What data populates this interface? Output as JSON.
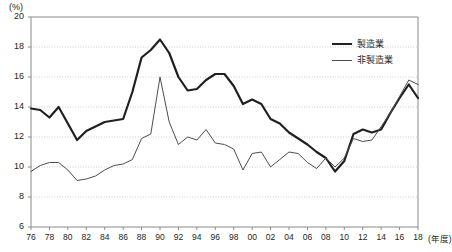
{
  "chart_data": {
    "type": "line",
    "title": "",
    "subtitle": "",
    "xlabel": "(年度)",
    "ylabel": "(%)",
    "unit_label": "(%)",
    "xlim": [
      1976,
      2018
    ],
    "ylim": [
      6,
      20
    ],
    "y_ticks": [
      6,
      8,
      10,
      12,
      14,
      16,
      18,
      20
    ],
    "y_tick_labels": [
      "6",
      "8",
      "10",
      "12",
      "14",
      "16",
      "18",
      "20"
    ],
    "x_ticks": [
      1976,
      1978,
      1980,
      1982,
      1984,
      1986,
      1988,
      1990,
      1992,
      1994,
      1996,
      1998,
      2000,
      2002,
      2004,
      2006,
      2008,
      2010,
      2012,
      2014,
      2016,
      2018
    ],
    "x_tick_labels": [
      "76",
      "78",
      "80",
      "82",
      "84",
      "86",
      "88",
      "90",
      "92",
      "94",
      "96",
      "98",
      "00",
      "02",
      "04",
      "06",
      "08",
      "10",
      "12",
      "14",
      "16",
      "18"
    ],
    "grid": true,
    "grid_style": "dotted-horizontal",
    "legend_position": "top-right",
    "x": [
      1976,
      1977,
      1978,
      1979,
      1980,
      1981,
      1982,
      1983,
      1984,
      1985,
      1986,
      1987,
      1988,
      1989,
      1990,
      1991,
      1992,
      1993,
      1994,
      1995,
      1996,
      1997,
      1998,
      1999,
      2000,
      2001,
      2002,
      2003,
      2004,
      2005,
      2006,
      2007,
      2008,
      2009,
      2010,
      2011,
      2012,
      2013,
      2014,
      2015,
      2016,
      2017,
      2018
    ],
    "series": [
      {
        "name": "製造業",
        "color": "#231f20",
        "width": 2.2,
        "values": [
          13.9,
          13.8,
          13.3,
          14.0,
          12.9,
          11.8,
          12.4,
          12.7,
          13.0,
          13.1,
          13.2,
          15.0,
          17.3,
          17.8,
          18.5,
          17.6,
          16.0,
          15.1,
          15.2,
          15.8,
          16.2,
          16.2,
          15.4,
          14.2,
          14.5,
          14.2,
          13.2,
          12.9,
          12.3,
          11.9,
          11.5,
          11.0,
          10.6,
          9.7,
          10.4,
          12.2,
          12.5,
          12.3,
          12.5,
          13.6,
          14.6,
          15.5,
          14.6
        ]
      },
      {
        "name": "非製造業",
        "color": "#4d4d4d",
        "width": 1.0,
        "values": [
          9.7,
          10.1,
          10.3,
          10.3,
          9.8,
          9.1,
          9.2,
          9.4,
          9.8,
          10.1,
          10.2,
          10.5,
          11.9,
          12.2,
          16.0,
          13.0,
          11.5,
          12.0,
          11.8,
          12.5,
          11.6,
          11.5,
          11.2,
          9.8,
          10.9,
          11.0,
          10.0,
          10.5,
          11.0,
          10.9,
          10.3,
          9.9,
          10.6,
          10.0,
          10.6,
          11.9,
          11.7,
          11.8,
          12.7,
          13.6,
          14.7,
          15.8,
          15.5
        ]
      }
    ]
  },
  "legend": {
    "items": [
      {
        "label": "製造業",
        "style": "thick"
      },
      {
        "label": "非製造業",
        "style": "thin"
      }
    ]
  },
  "axes": {
    "y_unit": "(%)",
    "x_unit": "(年度)"
  }
}
